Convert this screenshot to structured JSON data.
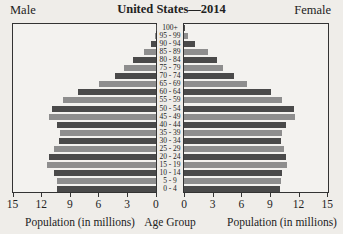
{
  "chart_data": {
    "type": "bar",
    "subtype": "population-pyramid",
    "title": "United States—2014",
    "left_label": "Male",
    "right_label": "Female",
    "xlabel_left": "Population (in millions)",
    "xlabel_center": "Age Group",
    "xlabel_right": "Population (in millions)",
    "xlim": [
      0,
      15
    ],
    "x_ticks_left": [
      "15",
      "12",
      "9",
      "6",
      "3",
      "0"
    ],
    "x_ticks_right": [
      "0",
      "3",
      "6",
      "9",
      "12",
      "15"
    ],
    "grid": false,
    "legend": "none",
    "categories": [
      "100+",
      "95 - 99",
      "90 - 94",
      "85 - 89",
      "80 - 84",
      "75 - 79",
      "70 - 74",
      "65 - 69",
      "60 - 64",
      "55 - 59",
      "50 - 54",
      "45 - 49",
      "40 - 44",
      "35 - 39",
      "30 - 34",
      "25 - 29",
      "20 - 24",
      "15 - 19",
      "10 - 14",
      "5 - 9",
      "0 - 4"
    ],
    "series": [
      {
        "name": "Male",
        "values": [
          0.02,
          0.1,
          0.5,
          1.3,
          2.4,
          3.3,
          4.3,
          6.0,
          8.2,
          9.7,
          10.9,
          11.2,
          10.4,
          10.1,
          10.2,
          10.7,
          11.2,
          11.4,
          10.7,
          10.4,
          10.4
        ]
      },
      {
        "name": "Female",
        "values": [
          0.07,
          0.4,
          1.2,
          2.5,
          3.5,
          4.1,
          5.2,
          6.6,
          9.1,
          10.3,
          11.5,
          11.6,
          10.7,
          10.3,
          10.2,
          10.5,
          10.7,
          10.8,
          10.3,
          10.2,
          10.1
        ]
      }
    ],
    "colors": {
      "dark": "#4a4a4a",
      "light": "#8e8e8e"
    }
  }
}
